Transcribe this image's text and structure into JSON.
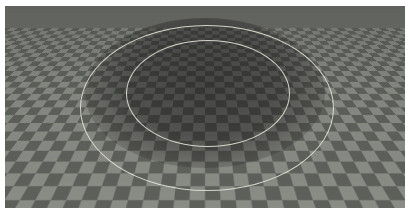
{
  "scene": {
    "description": "3D render of a checkerboard-textured ground plane with a circular depression, two thin white ring outlines",
    "colors": {
      "checker_light": "#8a8c86",
      "checker_dark": "#5e605b",
      "ring": "#ebebe1",
      "border": "#ffffff"
    },
    "rings": [
      {
        "name": "outer",
        "approx_bounds": [
          80,
          25,
          333,
          190
        ]
      },
      {
        "name": "inner",
        "approx_bounds": [
          126,
          40,
          290,
          146
        ]
      }
    ]
  }
}
